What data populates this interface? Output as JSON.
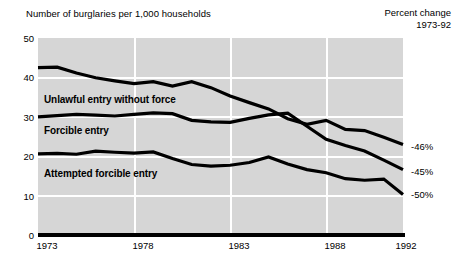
{
  "header": {
    "title_left": "Number of burglaries per 1,000 households",
    "title_right_line1": "Percent change",
    "title_right_line2": "1973-92"
  },
  "chart_data": {
    "type": "line",
    "title": "Number of burglaries per 1,000 households",
    "xlabel": "",
    "ylabel": "Number of burglaries per 1,000 households",
    "xlim": [
      1973,
      1992
    ],
    "ylim": [
      0,
      50
    ],
    "yticks": [
      0,
      10,
      20,
      30,
      40,
      50
    ],
    "xticks": [
      1973,
      1978,
      1983,
      1988,
      1992
    ],
    "grid": true,
    "legend_position": "inline-on-plot",
    "x": [
      1973,
      1974,
      1975,
      1976,
      1977,
      1978,
      1979,
      1980,
      1981,
      1982,
      1983,
      1984,
      1985,
      1986,
      1987,
      1988,
      1989,
      1990,
      1991,
      1992
    ],
    "series": [
      {
        "name": "Unlawful entry without force",
        "percent_change": "-46%",
        "values": [
          42.5,
          42.6,
          41.1,
          39.9,
          39.1,
          38.4,
          38.9,
          37.8,
          38.9,
          37.4,
          35.3,
          33.6,
          32.0,
          29.5,
          28.1,
          29.1,
          26.8,
          26.5,
          24.8,
          23.0
        ]
      },
      {
        "name": "Forcible entry",
        "percent_change": "-45%",
        "values": [
          30.0,
          30.3,
          30.6,
          30.4,
          30.2,
          30.6,
          31.0,
          30.8,
          29.1,
          28.7,
          28.6,
          29.6,
          30.5,
          30.9,
          27.6,
          24.3,
          22.7,
          21.3,
          19.0,
          16.6
        ]
      },
      {
        "name": "Attempted forcible entry",
        "percent_change": "-50%",
        "values": [
          20.6,
          20.7,
          20.5,
          21.3,
          21.0,
          20.8,
          21.1,
          19.4,
          17.9,
          17.5,
          17.7,
          18.4,
          19.8,
          18.0,
          16.6,
          15.8,
          14.3,
          13.9,
          14.2,
          10.3
        ]
      }
    ],
    "annotations": [
      {
        "text": "Unlawful entry without force",
        "kind": "series-label"
      },
      {
        "text": "Forcible entry",
        "kind": "series-label"
      },
      {
        "text": "Attempted forcible entry",
        "kind": "series-label"
      }
    ]
  },
  "axis": {
    "ytick_labels": [
      "50",
      "40",
      "30",
      "20",
      "10",
      "0"
    ],
    "xtick_labels": [
      "1973",
      "1978",
      "1983",
      "1988",
      "1992"
    ]
  },
  "labels": {
    "series1": "Unlawful entry without force",
    "series2": "Forcible entry",
    "series3": "Attempted forcible entry",
    "pct1": "-46%",
    "pct2": "-45%",
    "pct3": "-50%"
  }
}
